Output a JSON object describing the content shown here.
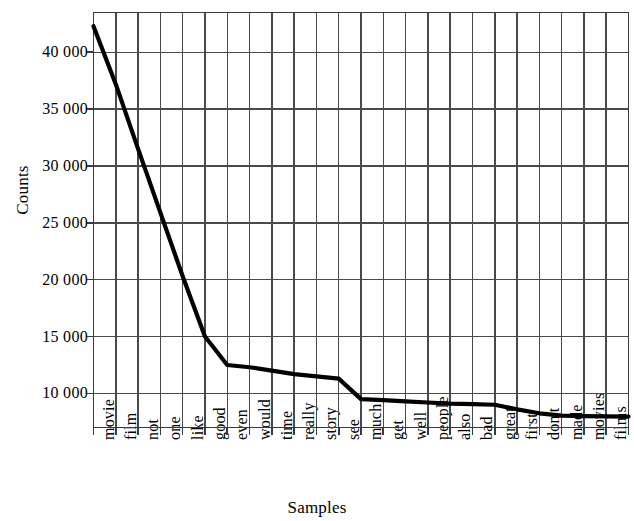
{
  "chart_data": {
    "type": "line",
    "title": "",
    "xlabel": "Samples",
    "ylabel": "Counts",
    "categories": [
      "movie",
      "film",
      "not",
      "one",
      "like",
      "good",
      "even",
      "would",
      "time",
      "really",
      "story",
      "see",
      "much",
      "get",
      "well",
      "people",
      "also",
      "bad",
      "great",
      "first",
      "don't",
      "made",
      "movies",
      "films",
      "make"
    ],
    "values": [
      42300,
      37200,
      31500,
      25900,
      20300,
      15000,
      12500,
      12300,
      12000,
      11700,
      11500,
      11300,
      9500,
      9400,
      9300,
      9200,
      9100,
      9050,
      9000,
      8600,
      8250,
      8050,
      8000,
      7980,
      7960
    ],
    "ylim": [
      7000,
      43500
    ],
    "yticks": [
      10000,
      15000,
      20000,
      25000,
      30000,
      35000,
      40000
    ],
    "ytick_labels": [
      "10 000",
      "15 000",
      "20 000",
      "25 000",
      "30 000",
      "35 000",
      "40 000"
    ],
    "grid": true,
    "legend": "none",
    "line_color": "#000000",
    "axis_color": "#3a3a3a",
    "grid_color": "#4a4a4a",
    "background_color": "#ffffff"
  }
}
